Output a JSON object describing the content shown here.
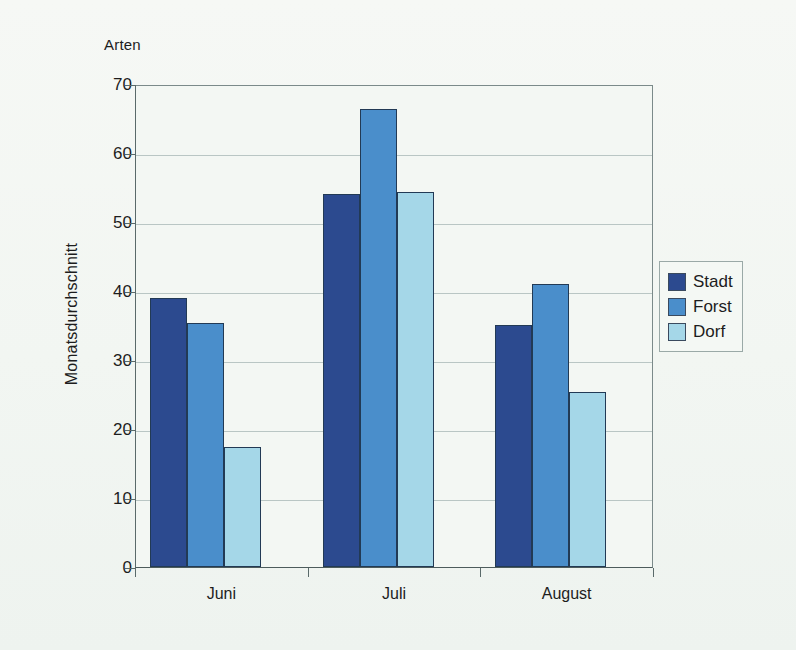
{
  "chart_data": {
    "type": "bar",
    "title": "",
    "unit_label": "Arten",
    "ylabel": "Monatsdurchschnitt",
    "xlabel": "",
    "categories": [
      "Juni",
      "Juli",
      "August"
    ],
    "series": [
      {
        "name": "Stadt",
        "color": "#2c4a8f",
        "values": [
          39.0,
          54.1,
          35.1
        ]
      },
      {
        "name": "Forst",
        "color": "#4a8ecb",
        "values": [
          35.4,
          66.4,
          41.0
        ]
      },
      {
        "name": "Dorf",
        "color": "#a5d7e8",
        "values": [
          17.4,
          54.3,
          25.3
        ]
      }
    ],
    "ylim": [
      0,
      70
    ],
    "yticks": [
      0,
      10,
      20,
      30,
      40,
      50,
      60,
      70
    ],
    "ytick_labels": [
      "0",
      "10",
      "20",
      "30",
      "40",
      "50",
      "60",
      "70"
    ],
    "grid": true,
    "legend_position": "right"
  },
  "legend": {
    "entries": [
      {
        "label": "Stadt"
      },
      {
        "label": "Forst"
      },
      {
        "label": "Dorf"
      }
    ]
  }
}
